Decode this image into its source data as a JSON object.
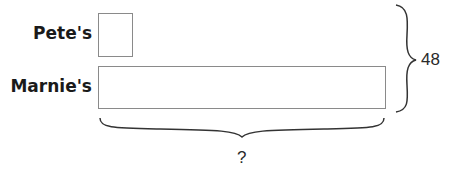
{
  "diagram": {
    "type": "tape-diagram",
    "bars": [
      {
        "label": "Pete's",
        "units": 1
      },
      {
        "label": "Marnie's",
        "units": 8
      }
    ],
    "total_brace_label": "48",
    "bottom_brace_label": "?"
  }
}
